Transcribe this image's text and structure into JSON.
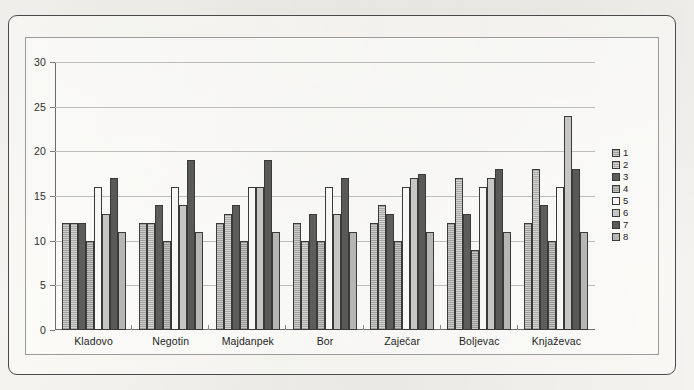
{
  "chart_data": {
    "type": "bar",
    "title": "",
    "subtitle": "",
    "xlabel": "",
    "ylabel": "",
    "ylim": [
      0,
      30
    ],
    "ytick_step": 5,
    "yticks": [
      0,
      5,
      10,
      15,
      20,
      25,
      30
    ],
    "grid": true,
    "legend_position": "right",
    "categories": [
      "Kladovo",
      "Negotin",
      "Majdanpek",
      "Bor",
      "Zaječar",
      "Boljevac",
      "Knjaževac"
    ],
    "series": [
      {
        "name": "1",
        "values": [
          12,
          12,
          12,
          12,
          12,
          12,
          12
        ]
      },
      {
        "name": "2",
        "values": [
          12,
          12,
          13,
          10,
          14,
          17,
          18
        ]
      },
      {
        "name": "3",
        "values": [
          12,
          14,
          14,
          13,
          13,
          13,
          14
        ]
      },
      {
        "name": "4",
        "values": [
          10,
          10,
          10,
          10,
          10,
          9,
          10
        ]
      },
      {
        "name": "5",
        "values": [
          16,
          16,
          16,
          16,
          16,
          16,
          16
        ]
      },
      {
        "name": "6",
        "values": [
          13,
          14,
          16,
          13,
          17,
          17,
          24
        ]
      },
      {
        "name": "7",
        "values": [
          17,
          19,
          19,
          17,
          17.5,
          18,
          18
        ]
      },
      {
        "name": "8",
        "values": [
          11,
          11,
          11,
          11,
          11,
          11,
          11
        ]
      }
    ]
  },
  "legend": {
    "entries": [
      {
        "label": "1",
        "swatch_class": "s1",
        "color": "#b4b4b2"
      },
      {
        "label": "2",
        "swatch_class": "s2",
        "color": "#bfbfbd"
      },
      {
        "label": "3",
        "swatch_class": "s3",
        "color": "#5d5d5b"
      },
      {
        "label": "4",
        "swatch_class": "s4",
        "color": "#aeaeac"
      },
      {
        "label": "5",
        "swatch_class": "s5",
        "color": "#f7f7f5"
      },
      {
        "label": "6",
        "swatch_class": "s6",
        "color": "#c6c6c3"
      },
      {
        "label": "7",
        "swatch_class": "s7",
        "color": "#595957"
      },
      {
        "label": "8",
        "swatch_class": "s8",
        "color": "#b6b6b3"
      }
    ]
  },
  "axis": {
    "y_tick_labels": [
      "30",
      "25",
      "20",
      "15",
      "10",
      "5",
      "0"
    ]
  },
  "colors": {
    "frame": "#4a4a4a",
    "gridline": "#bdbdbb",
    "axis": "#6d6d6d",
    "text": "#1f1f1f",
    "background": "#f4f2ee"
  }
}
